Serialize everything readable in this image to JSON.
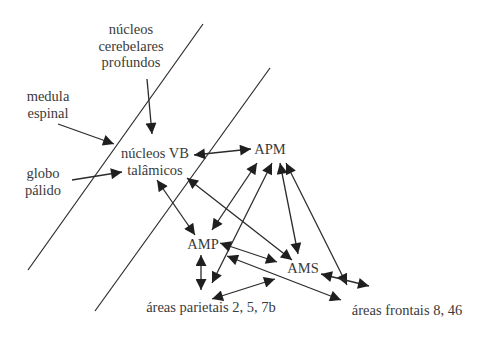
{
  "diagram": {
    "type": "neural pathway diagram",
    "nodes": {
      "cerebellar": {
        "lines": [
          "núcleos",
          "cerebelares",
          "profundos"
        ]
      },
      "spinal": {
        "lines": [
          "medula",
          "espinal"
        ]
      },
      "globus": {
        "lines": [
          "globo",
          "pálido"
        ]
      },
      "vb": {
        "lines": [
          "núcleos VB",
          "talâmicos"
        ]
      },
      "apm": {
        "lines": [
          "APM"
        ]
      },
      "amp": {
        "lines": [
          "AMP"
        ]
      },
      "ams": {
        "lines": [
          "AMS"
        ]
      },
      "parietal": {
        "lines": [
          "áreas parietais 2, 5, 7b"
        ]
      },
      "frontal": {
        "lines": [
          "áreas frontais 8, 46"
        ]
      }
    },
    "edges": [
      {
        "from": "núcleos cerebelares profundos",
        "to": "núcleos VB talâmicos",
        "direction": "one-way"
      },
      {
        "from": "medula espinal",
        "to": "núcleos VB talâmicos",
        "direction": "one-way"
      },
      {
        "from": "globo pálido",
        "to": "núcleos VB talâmicos",
        "direction": "one-way"
      },
      {
        "from": "núcleos VB talâmicos",
        "to": "APM",
        "direction": "two-way"
      },
      {
        "from": "núcleos VB talâmicos",
        "to": "AMP",
        "direction": "two-way"
      },
      {
        "from": "núcleos VB talâmicos",
        "to": "AMS",
        "direction": "two-way"
      },
      {
        "from": "APM",
        "to": "AMP",
        "direction": "two-way"
      },
      {
        "from": "APM",
        "to": "áreas parietais 2, 5, 7b",
        "direction": "two-way"
      },
      {
        "from": "APM",
        "to": "AMS",
        "direction": "two-way"
      },
      {
        "from": "APM",
        "to": "áreas frontais 8, 46",
        "direction": "two-way"
      },
      {
        "from": "AMP",
        "to": "AMS",
        "direction": "two-way"
      },
      {
        "from": "AMP",
        "to": "áreas parietais 2, 5, 7b",
        "direction": "two-way"
      },
      {
        "from": "AMP",
        "to": "áreas frontais 8, 46",
        "direction": "two-way"
      },
      {
        "from": "AMS",
        "to": "áreas parietais 2, 5, 7b",
        "direction": "two-way"
      },
      {
        "from": "AMS",
        "to": "áreas frontais 8, 46",
        "direction": "two-way"
      }
    ],
    "separators": 2,
    "colors": {
      "ink": "#2b2b2b",
      "text": "#3a3a3a",
      "background": "#ffffff"
    }
  }
}
